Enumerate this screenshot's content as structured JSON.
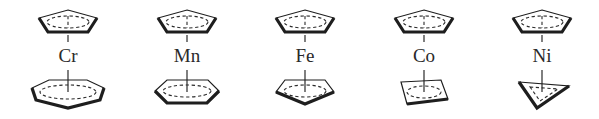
{
  "figure": {
    "complexes": [
      {
        "metal": "Cr",
        "top_ring": "cyclopentadienyl (C5)",
        "bottom_ring": "cycloheptatrienyl (C7)",
        "center_x": 68
      },
      {
        "metal": "Mn",
        "top_ring": "cyclopentadienyl (C5)",
        "bottom_ring": "benzene (C6)",
        "center_x": 187
      },
      {
        "metal": "Fe",
        "top_ring": "cyclopentadienyl (C5)",
        "bottom_ring": "cyclopentadienyl (C5)",
        "center_x": 305
      },
      {
        "metal": "Co",
        "top_ring": "cyclopentadienyl (C5)",
        "bottom_ring": "cyclobutadiene (C4)",
        "center_x": 424
      },
      {
        "metal": "Ni",
        "top_ring": "cyclopentadienyl (C5)",
        "bottom_ring": "cyclopropenyl (C3)",
        "center_x": 542
      }
    ]
  },
  "labels": {
    "cr": "Cr",
    "mn": "Mn",
    "fe": "Fe",
    "co": "Co",
    "ni": "Ni"
  },
  "colors": {
    "ink": "#1e1e1e",
    "background": "#ffffff"
  }
}
